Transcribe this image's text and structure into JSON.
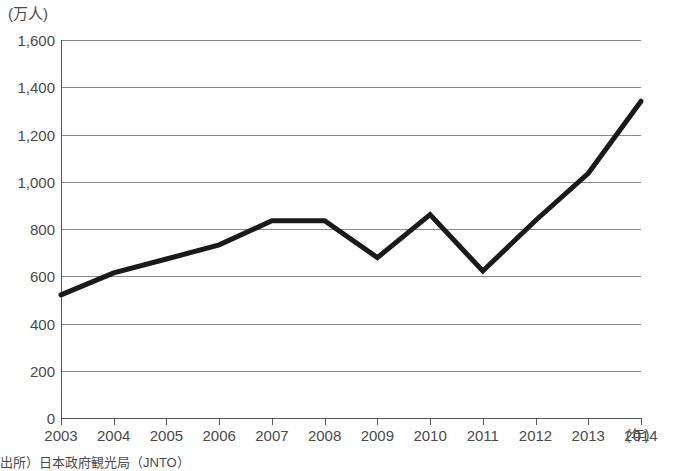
{
  "chart_data": {
    "type": "line",
    "title": "",
    "subtitle": "",
    "xlabel": "(年)",
    "ylabel": "(万人)",
    "x": [
      2003,
      2004,
      2005,
      2006,
      2007,
      2008,
      2009,
      2010,
      2011,
      2012,
      2013,
      2014
    ],
    "categories": [
      "2003",
      "2004",
      "2005",
      "2006",
      "2007",
      "2008",
      "2009",
      "2010",
      "2011",
      "2012",
      "2013",
      "2014"
    ],
    "values": [
      521,
      614,
      673,
      733,
      835,
      835,
      679,
      861,
      622,
      836,
      1036,
      1341
    ],
    "series": [
      {
        "name": "訪日外客数",
        "values": [
          521,
          614,
          673,
          733,
          835,
          835,
          679,
          861,
          622,
          836,
          1036,
          1341
        ],
        "color": "#1a1a1a"
      }
    ],
    "xlim": [
      2003,
      2014
    ],
    "ylim": [
      0,
      1600
    ],
    "ytick_labels": [
      "1,600",
      "1,400",
      "1,200",
      "1,000",
      "800",
      "600",
      "400",
      "200",
      "0"
    ],
    "ytick_values": [
      1600,
      1400,
      1200,
      1000,
      800,
      600,
      400,
      200,
      0
    ],
    "grid": true,
    "grid_axis": "y",
    "legend": false,
    "legend_position": "none",
    "line_width": 5,
    "markers": false
  },
  "axes": {
    "y_unit_label": "(万人)",
    "x_unit_label": "(年)"
  },
  "footer": {
    "source_note": "出所）日本政府観光局（JNTO）"
  },
  "colors": {
    "line": "#1a1a1a",
    "grid": "#8a8a8a",
    "axis": "#555555",
    "text": "#4a4a4a",
    "background": "#ffffff"
  }
}
